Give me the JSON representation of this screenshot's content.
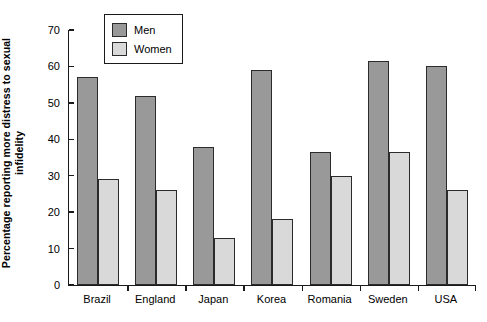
{
  "chart_data": {
    "type": "bar",
    "title": "",
    "xlabel": "",
    "ylabel": "Percentage reporting more distress to sexual infidelity",
    "ylabel_lines": [
      "Percentage reporting more distress to sexual",
      "infidelity"
    ],
    "ylim": [
      0,
      70
    ],
    "ytick_labels": [
      "0",
      "10",
      "20",
      "30",
      "40",
      "50",
      "60",
      "70"
    ],
    "ytick_values": [
      0,
      10,
      20,
      30,
      40,
      50,
      60,
      70
    ],
    "grid": false,
    "legend_position": "top-left-inside",
    "categories": [
      "Brazil",
      "England",
      "Japan",
      "Korea",
      "Romania",
      "Sweden",
      "USA"
    ],
    "series": [
      {
        "name": "Men",
        "color": "#999999",
        "values": [
          57,
          52,
          38,
          59,
          36.5,
          61.5,
          60
        ]
      },
      {
        "name": "Women",
        "color": "#d9d9d9",
        "values": [
          29,
          26,
          13,
          18,
          30,
          36.5,
          26
        ]
      }
    ]
  },
  "legend": {
    "items": [
      {
        "label": "Men",
        "color": "#999999"
      },
      {
        "label": "Women",
        "color": "#d9d9d9"
      }
    ]
  },
  "colors": {
    "men": "#999999",
    "women": "#d9d9d9",
    "axis": "#1a1a1a",
    "bar_outline": "#2b2b2b",
    "background": "#ffffff"
  }
}
